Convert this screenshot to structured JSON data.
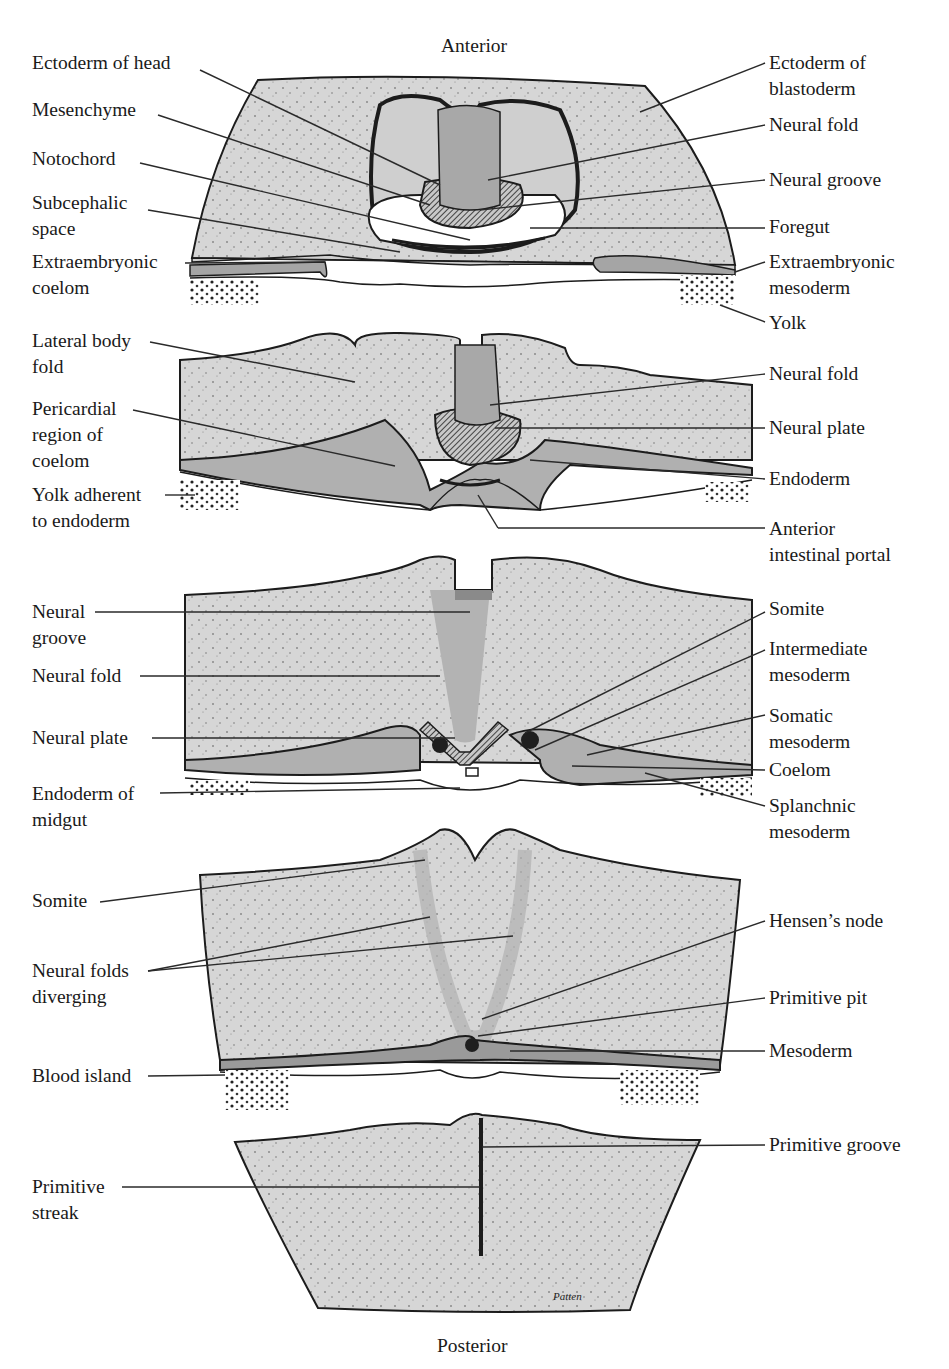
{
  "figure": {
    "orientation": {
      "top": "Anterior",
      "bottom": "Posterior"
    },
    "signature": "Patten",
    "colors": {
      "tissue": "#d4d4d4",
      "tissue_dark": "#a9a9a9",
      "outline": "#1c1c1c",
      "leader": "#2a2a2a",
      "cavity": "#ffffff"
    },
    "sections": [
      {
        "id": "section-1-head",
        "left_labels": [
          "Ectoderm of head",
          "Mesenchyme",
          "Notochord",
          "Subcephalic\nspace",
          "Extraembryonic\ncoelom"
        ],
        "right_labels": [
          "Ectoderm of\nblastoderm",
          "Neural fold",
          "Neural groove",
          "Foregut",
          "Extraembryonic\nmesoderm",
          "Yolk"
        ]
      },
      {
        "id": "section-2-heart",
        "left_labels": [
          "Lateral body\nfold",
          "Pericardial\nregion of\ncoelom",
          "Yolk adherent\nto endoderm"
        ],
        "right_labels": [
          "Neural fold",
          "Neural plate",
          "Endoderm",
          "Anterior\nintestinal portal"
        ]
      },
      {
        "id": "section-3-midgut",
        "left_labels": [
          "Neural\ngroove",
          "Neural fold",
          "Neural plate",
          "Endoderm of\nmidgut"
        ],
        "right_labels": [
          "Somite",
          "Intermediate\nmesoderm",
          "Somatic\nmesoderm",
          "Coelom",
          "Splanchnic\nmesoderm"
        ]
      },
      {
        "id": "section-4-node",
        "left_labels": [
          "Somite",
          "Neural folds\ndiverging",
          "Blood island"
        ],
        "right_labels": [
          "Hensen’s node",
          "Primitive pit",
          "Mesoderm"
        ]
      },
      {
        "id": "section-5-streak",
        "left_labels": [
          "Primitive\nstreak"
        ],
        "right_labels": [
          "Primitive groove"
        ]
      }
    ]
  }
}
